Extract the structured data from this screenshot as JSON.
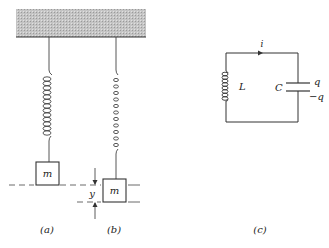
{
  "figure": {
    "panels": [
      {
        "id": "a",
        "caption": "(a)",
        "mass_label": "m"
      },
      {
        "id": "b",
        "caption": "(b)",
        "mass_label": "m",
        "displacement_label": "y"
      },
      {
        "id": "c",
        "caption": "(c)",
        "current_label": "i",
        "inductor_label": "L",
        "capacitor_label": "C",
        "charge_top": "q",
        "charge_bottom": "−q"
      }
    ]
  },
  "colors": {
    "line": "#333333",
    "ceiling": "#b8b8b8"
  }
}
